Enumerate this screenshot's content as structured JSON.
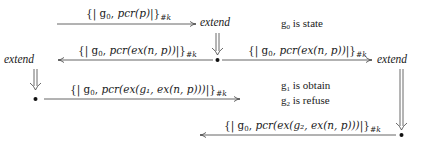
{
  "diagram": {
    "nodes": {
      "extend_top": "extend",
      "extend_left": "extend",
      "extend_right": "extend"
    },
    "messages": [
      {
        "id": "m1",
        "g": "g",
        "g_sub": "0",
        "term": "pcr(p)",
        "suffix": "#k",
        "direction": "right"
      },
      {
        "id": "m2",
        "g": "g",
        "g_sub": "0",
        "term": "pcr(ex(n, p))",
        "suffix": "#k",
        "direction": "left"
      },
      {
        "id": "m3",
        "g": "g",
        "g_sub": "0",
        "term": "pcr(ex(n, p))",
        "suffix": "#k",
        "direction": "right"
      },
      {
        "id": "m4",
        "g": "g",
        "g_sub": "0",
        "term": "pcr(ex(g₁, ex(n, p)))",
        "suffix": "#k",
        "direction": "right"
      },
      {
        "id": "m5",
        "g": "g",
        "g_sub": "0",
        "term": "pcr(ex(g₂, ex(n, p)))",
        "suffix": "#k",
        "direction": "left"
      }
    ],
    "legend": [
      {
        "sym": "g",
        "sub": "0",
        "text": "is state"
      },
      {
        "sym": "g",
        "sub": "1",
        "text": "is obtain"
      },
      {
        "sym": "g",
        "sub": "2",
        "text": "is refuse"
      }
    ],
    "colors": {
      "ink": "#1a1a1a",
      "arrow": "#555555"
    }
  }
}
